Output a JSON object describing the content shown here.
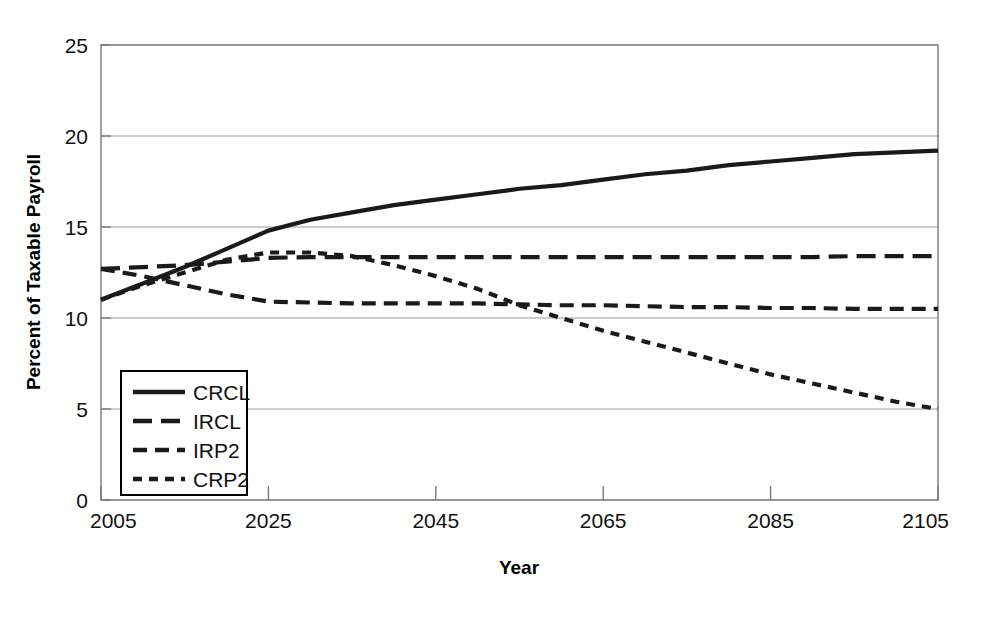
{
  "chart_data": {
    "type": "line",
    "title": "",
    "xlabel": "Year",
    "ylabel": "Percent of Taxable Payroll",
    "xlim": [
      2005,
      2105
    ],
    "ylim": [
      0,
      25
    ],
    "xticks": [
      "2005",
      "2025",
      "2045",
      "2065",
      "2085",
      "2105"
    ],
    "xtick_values": [
      2005,
      2025,
      2045,
      2065,
      2085,
      2105
    ],
    "yticks": [
      "0",
      "5",
      "10",
      "15",
      "20",
      "25"
    ],
    "ytick_values": [
      0,
      5,
      10,
      15,
      20,
      25
    ],
    "grid": true,
    "grid_axis": "y",
    "legend_position": "lower-left-inside",
    "x": [
      2005,
      2010,
      2015,
      2020,
      2025,
      2030,
      2035,
      2040,
      2045,
      2050,
      2055,
      2060,
      2065,
      2070,
      2075,
      2080,
      2085,
      2090,
      2095,
      2100,
      2105
    ],
    "series": [
      {
        "name": "CRCL",
        "style": "solid",
        "color": "#1a1a1a",
        "values": [
          11.0,
          11.9,
          12.8,
          13.8,
          14.8,
          15.4,
          15.8,
          16.2,
          16.5,
          16.8,
          17.1,
          17.3,
          17.6,
          17.9,
          18.1,
          18.4,
          18.6,
          18.8,
          19.0,
          19.1,
          19.2
        ]
      },
      {
        "name": "IRCL",
        "style": "long-dash",
        "color": "#1a1a1a",
        "values": [
          12.7,
          12.8,
          12.9,
          13.1,
          13.3,
          13.35,
          13.35,
          13.35,
          13.35,
          13.35,
          13.35,
          13.35,
          13.35,
          13.35,
          13.35,
          13.35,
          13.35,
          13.35,
          13.4,
          13.4,
          13.4
        ]
      },
      {
        "name": "IRP2",
        "style": "medium-dash",
        "color": "#1a1a1a",
        "values": [
          12.7,
          12.3,
          11.8,
          11.3,
          10.9,
          10.85,
          10.8,
          10.8,
          10.8,
          10.8,
          10.75,
          10.7,
          10.7,
          10.65,
          10.6,
          10.6,
          10.55,
          10.55,
          10.5,
          10.5,
          10.5
        ]
      },
      {
        "name": "CRP2",
        "style": "short-dash",
        "color": "#1a1a1a",
        "values": [
          11.0,
          11.8,
          12.5,
          13.2,
          13.6,
          13.6,
          13.4,
          12.9,
          12.3,
          11.6,
          10.7,
          10.0,
          9.3,
          8.7,
          8.1,
          7.5,
          6.9,
          6.4,
          5.9,
          5.4,
          5.0
        ]
      }
    ],
    "legend_entries": [
      {
        "label": "CRCL",
        "style": "solid"
      },
      {
        "label": "IRCL",
        "style": "long-dash"
      },
      {
        "label": "IRP2",
        "style": "medium-dash"
      },
      {
        "label": "CRP2",
        "style": "short-dash"
      }
    ]
  }
}
